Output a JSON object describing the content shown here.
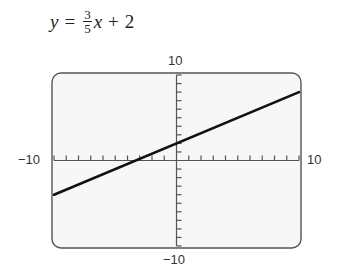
{
  "equation": {
    "lhs": "y",
    "equals": "=",
    "numerator": "3",
    "denominator": "5",
    "variable": "x",
    "plus": "+",
    "constant": "2"
  },
  "axis_labels": {
    "y_max": "10",
    "y_min": "−10",
    "x_min": "−10",
    "x_max": "10"
  },
  "colors": {
    "frame": "#555555",
    "line": "#111111",
    "screen": "#f7f7f7"
  },
  "chart_data": {
    "type": "line",
    "xlabel": "",
    "ylabel": "",
    "xlim": [
      -10,
      10
    ],
    "ylim": [
      -10,
      10
    ],
    "x_tick_step": 1,
    "y_tick_step": 1,
    "grid": false,
    "legend": null,
    "series": [
      {
        "name": "y = 3/5 x + 2",
        "x": [
          -10,
          10
        ],
        "y": [
          -4,
          8
        ]
      }
    ],
    "annotations": [
      "10",
      "−10",
      "−10",
      "10"
    ]
  }
}
